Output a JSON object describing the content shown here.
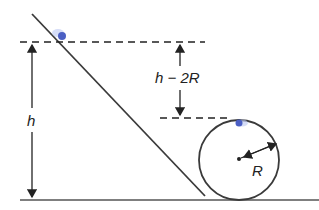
{
  "diagram": {
    "type": "physics-loop-the-loop",
    "labels": {
      "height": "h",
      "height_difference": "h − 2R",
      "radius": "R"
    },
    "colors": {
      "line": "#3a3a3a",
      "ball": "#4b5fc4",
      "ball_glow": "#b9c6f2",
      "background": "#ffffff"
    },
    "elements": {
      "incline": "straight ramp descending from top-left to the loop",
      "ball_start": "ball on incline at height h",
      "ball_top": "ball at top of circular loop",
      "loop": "circular loop of radius R",
      "ground": "horizontal ground line"
    }
  }
}
